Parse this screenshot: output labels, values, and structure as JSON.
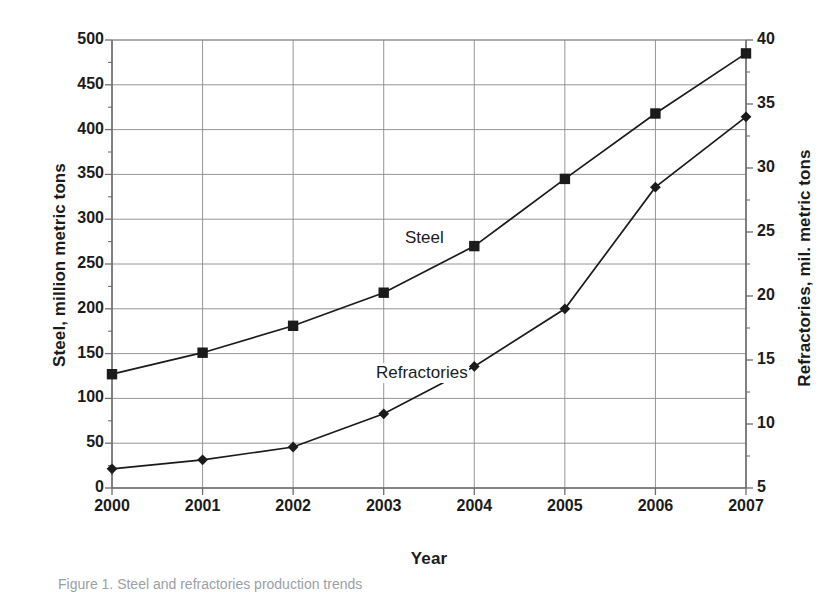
{
  "chart_data": {
    "type": "line",
    "title": "",
    "xlabel": "Year",
    "categories": [
      "2000",
      "2001",
      "2002",
      "2003",
      "2004",
      "2005",
      "2006",
      "2007"
    ],
    "grid": true,
    "legend_position": "inline-annotations",
    "series": [
      {
        "name": "Steel",
        "axis": "left",
        "marker": "square",
        "color": "#1b1b1b",
        "values": [
          127,
          151,
          181,
          218,
          270,
          345,
          418,
          485
        ]
      },
      {
        "name": "Refractories",
        "axis": "right",
        "marker": "diamond",
        "color": "#1b1b1b",
        "values": [
          6.5,
          7.2,
          8.2,
          10.8,
          14.5,
          19.0,
          28.5,
          34.0
        ]
      }
    ],
    "left_axis": {
      "label": "Steel, million metric tons",
      "ylim": [
        0,
        500
      ],
      "ticks": [
        0,
        50,
        100,
        150,
        200,
        250,
        300,
        350,
        400,
        450,
        500
      ],
      "tick_labels": [
        "0",
        "50",
        "100",
        "150",
        "200",
        "250",
        "300",
        "350",
        "400",
        "450",
        "500"
      ]
    },
    "right_axis": {
      "label": "Refractories, mil. metric tons",
      "ylim": [
        5,
        40
      ],
      "ticks": [
        5,
        10,
        15,
        20,
        25,
        30,
        35,
        40
      ],
      "tick_labels": [
        "5",
        "10",
        "15",
        "20",
        "25",
        "30",
        "35",
        "40"
      ]
    }
  },
  "annotations": {
    "steel": "Steel",
    "refractories": "Refractories"
  },
  "caption": "Figure 1. Steel and refractories production trends",
  "colors": {
    "line": "#1b1b1b",
    "grid": "#8a8a8a",
    "axis": "#6e6e6e",
    "text": "#1b1b1b"
  }
}
